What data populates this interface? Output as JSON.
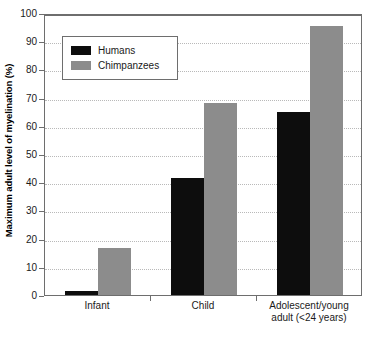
{
  "chart_data": {
    "type": "bar",
    "title": "",
    "subtitle": "",
    "xlabel": "",
    "ylabel": "Maximum adult level of myelination (%)",
    "categories": [
      "Infant",
      "Child",
      "Adolescent/young adult (<24 years)"
    ],
    "category_lines": [
      [
        "Infant"
      ],
      [
        "Child"
      ],
      [
        "Adolescent/young",
        "adult (<24 years)"
      ]
    ],
    "series": [
      {
        "name": "Humans",
        "color": "#0d0d0d",
        "values": [
          1.5,
          41.5,
          65
        ]
      },
      {
        "name": "Chimpanzees",
        "color": "#8c8c8c",
        "values": [
          16.5,
          68,
          95.5
        ]
      }
    ],
    "ylim": [
      0,
      100
    ],
    "yticks": [
      0,
      10,
      20,
      30,
      40,
      50,
      60,
      70,
      80,
      90,
      100
    ],
    "ytick_labels": [
      "0",
      "10",
      "20",
      "30",
      "40",
      "50",
      "60",
      "70",
      "80",
      "90",
      "100"
    ],
    "grid": true,
    "grid_style": "dotted",
    "grid_color": "#b9b9b9",
    "legend_position": "upper left",
    "axis_color": "#6e6e6e",
    "background": "#ffffff"
  },
  "legend": {
    "entries": [
      {
        "label": "Humans",
        "color": "#0d0d0d"
      },
      {
        "label": "Chimpanzees",
        "color": "#8c8c8c"
      }
    ]
  }
}
